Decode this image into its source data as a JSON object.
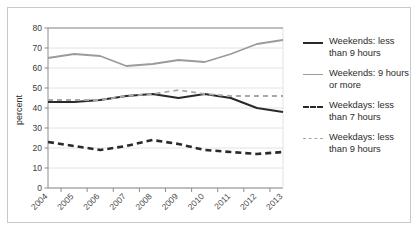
{
  "chart_data": {
    "type": "line",
    "title": "",
    "xlabel": "",
    "ylabel": "percent",
    "ylim": [
      0,
      80
    ],
    "yticks": [
      0,
      10,
      20,
      30,
      40,
      50,
      60,
      70,
      80
    ],
    "grid": true,
    "legend_position": "right",
    "categories": [
      "2004",
      "2005",
      "2006",
      "2007",
      "2008",
      "2009",
      "2010",
      "2011",
      "2012",
      "2013"
    ],
    "series": [
      {
        "name": "Weekends: less than 9 hours",
        "style": "solid",
        "color": "#2a2a2a",
        "width": 2.2,
        "values": [
          43,
          43,
          44,
          46,
          47,
          45,
          47,
          45,
          40,
          38
        ]
      },
      {
        "name": "Weekends: 9 hours or more",
        "style": "solid",
        "color": "#9b9b9b",
        "width": 1.8,
        "values": [
          65,
          67,
          66,
          61,
          62,
          64,
          63,
          67,
          72,
          74
        ]
      },
      {
        "name": "Weekdays: less than 7 hours",
        "style": "dashed",
        "color": "#2a2a2a",
        "width": 2.6,
        "values": [
          23,
          21,
          19,
          21,
          24,
          22,
          19,
          18,
          17,
          18
        ]
      },
      {
        "name": "Weekdays: less than 9 hours",
        "style": "dashed",
        "color": "#a8a8a8",
        "width": 1.8,
        "values": [
          44,
          44,
          44,
          46,
          47,
          49,
          47,
          46,
          46,
          46
        ]
      }
    ]
  },
  "axis": {
    "ylabel": "percent",
    "ytick_labels": [
      "0",
      "10",
      "20",
      "30",
      "40",
      "50",
      "60",
      "70",
      "80"
    ],
    "xtick_labels": [
      "2004",
      "2005",
      "2006",
      "2007",
      "2008",
      "2009",
      "2010",
      "2011",
      "2012",
      "2013"
    ]
  },
  "legend": {
    "items": [
      {
        "label": "Weekends: less\nthan 9 hours",
        "swatch": "solid-dark-line-icon"
      },
      {
        "label": "Weekends: 9 hours\nor more",
        "swatch": "solid-gray-line-icon"
      },
      {
        "label": "Weekdays: less\nthan 7 hours",
        "swatch": "dashed-dark-line-icon"
      },
      {
        "label": "Weekdays: less\nthan 9 hours",
        "swatch": "dashed-gray-line-icon"
      }
    ]
  },
  "colors": {
    "series_dark": "#2a2a2a",
    "series_gray": "#9b9b9b",
    "series_gray_light": "#a8a8a8",
    "grid": "#e2e2e2",
    "axis": "#8c8c8c",
    "frame": "#c9c9c9"
  }
}
